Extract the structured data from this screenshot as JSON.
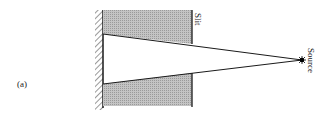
{
  "figure": {
    "panel_label": "(a)",
    "slit_label": "Slit",
    "source_label": "Source",
    "colors": {
      "block_fill": "#b5b5b5",
      "line": "#1a1a1a",
      "background": "#ffffff"
    }
  }
}
